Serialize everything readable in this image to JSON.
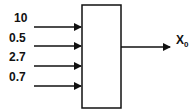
{
  "diagram": {
    "inputs": [
      {
        "label": "10"
      },
      {
        "label": "0.5"
      },
      {
        "label": "2.7"
      },
      {
        "label": "0.7"
      }
    ],
    "output": {
      "label": "X",
      "subscript": "0"
    },
    "colors": {
      "stroke": "#111111",
      "background": "#ffffff"
    }
  }
}
